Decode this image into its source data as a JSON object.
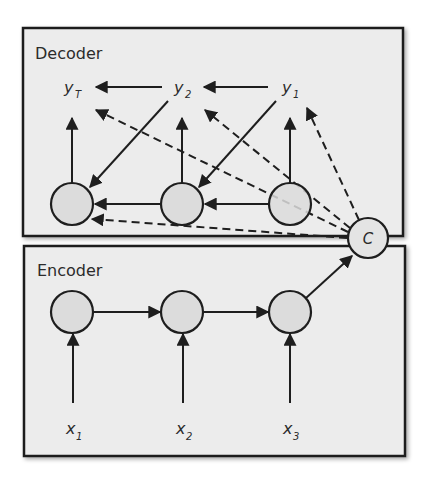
{
  "decoder": {
    "title": "Decoder",
    "outputs": [
      {
        "base": "y",
        "sub": "T"
      },
      {
        "base": "y",
        "sub": "2"
      },
      {
        "base": "y",
        "sub": "1"
      }
    ]
  },
  "encoder": {
    "title": "Encoder",
    "inputs": [
      {
        "base": "x",
        "sub": "1"
      },
      {
        "base": "x",
        "sub": "2"
      },
      {
        "base": "x",
        "sub": "3"
      }
    ]
  },
  "context": {
    "label": "C"
  },
  "colors": {
    "box_fill": "#ececec",
    "node_fill": "#dcdcdc",
    "stroke": "#1e1e1e",
    "background": "#ffffff"
  }
}
